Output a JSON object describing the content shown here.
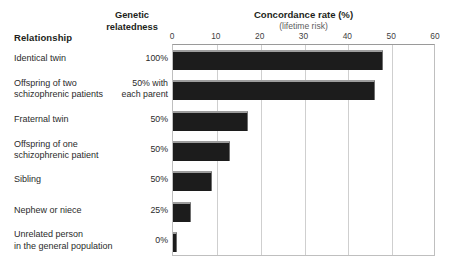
{
  "header": {
    "relationship_label": "Relationship",
    "genetic_label": "Genetic\nrelatedness",
    "genetic_line1": "Genetic",
    "genetic_line2": "relatedness"
  },
  "chart_data": {
    "type": "bar",
    "orientation": "horizontal",
    "title": "Concordance rate (%)",
    "subtitle": "(lifetime risk)",
    "xlabel": "Concordance rate (%)",
    "ylabel": "Relationship",
    "xlim": [
      0,
      60
    ],
    "xticks": [
      0,
      10,
      20,
      30,
      40,
      50,
      60
    ],
    "xtick_labels": [
      "0",
      "10",
      "20",
      "30",
      "40",
      "50",
      "60"
    ],
    "grid": true,
    "legend": "none",
    "bar_color": "#1c1c1c",
    "categories": [
      "Identical twin",
      "Offspring of two schizophrenic patients",
      "Fraternal twin",
      "Offspring of one schizophrenic patient",
      "Sibling",
      "Nephew or niece",
      "Unrelated person in the general population"
    ],
    "values": [
      48,
      46,
      17,
      13,
      9,
      4,
      1
    ],
    "annotations": {
      "genetic_relatedness": [
        "100%",
        "50% with each parent",
        "50%",
        "50%",
        "50%",
        "25%",
        "0%"
      ]
    }
  },
  "rows": [
    {
      "label_line1": "Identical twin",
      "label_line2": "",
      "pct_line1": "100%",
      "pct_line2": "",
      "value": 48
    },
    {
      "label_line1": "Offspring of two",
      "label_line2": "schizophrenic patients",
      "pct_line1": "50% with",
      "pct_line2": "each parent",
      "value": 46
    },
    {
      "label_line1": "Fraternal twin",
      "label_line2": "",
      "pct_line1": "50%",
      "pct_line2": "",
      "value": 17
    },
    {
      "label_line1": "Offspring of one",
      "label_line2": "schizophrenic patient",
      "pct_line1": "50%",
      "pct_line2": "",
      "value": 13
    },
    {
      "label_line1": "Sibling",
      "label_line2": "",
      "pct_line1": "50%",
      "pct_line2": "",
      "value": 9
    },
    {
      "label_line1": "Nephew or niece",
      "label_line2": "",
      "pct_line1": "25%",
      "pct_line2": "",
      "value": 4
    },
    {
      "label_line1": "Unrelated person",
      "label_line2": "in the general population",
      "pct_line1": "0%",
      "pct_line2": "",
      "value": 1
    }
  ]
}
